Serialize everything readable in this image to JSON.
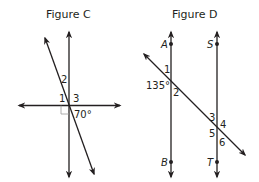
{
  "figures": [
    {
      "title": "Figure C",
      "angle_labels": [
        "1",
        "2",
        "3"
      ],
      "given_angle": "70°",
      "right_angle_marker": true
    },
    {
      "title": "Figure D",
      "points": [
        "A",
        "B",
        "S",
        "T"
      ],
      "angle_labels": [
        "1",
        "2",
        "3",
        "4",
        "5",
        "6"
      ],
      "given_angle": "135°"
    }
  ],
  "colors": {
    "line": "#231f20",
    "marker": "#9a9a9a"
  }
}
